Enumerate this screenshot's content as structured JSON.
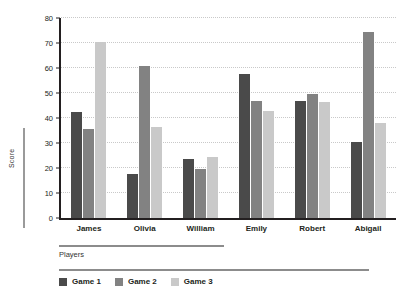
{
  "chart_data": {
    "type": "bar",
    "title": "",
    "xlabel": "Players",
    "ylabel": "Score",
    "ylim": [
      0,
      80
    ],
    "yticks": [
      0,
      10,
      20,
      30,
      40,
      50,
      60,
      70,
      80
    ],
    "grid": true,
    "legend_position": "bottom-left",
    "categories": [
      "James",
      "Olivia",
      "William",
      "Emily",
      "Robert",
      "Abigail"
    ],
    "series": [
      {
        "name": "Game 1",
        "color": "#4a4a4a",
        "values": [
          42.5,
          17.5,
          23.5,
          57.5,
          47,
          30.5
        ]
      },
      {
        "name": "Game 2",
        "color": "#828282",
        "values": [
          35.5,
          61,
          19.5,
          47,
          49.5,
          74.5
        ]
      },
      {
        "name": "Game 3",
        "color": "#c9c9c9",
        "values": [
          70.5,
          36.5,
          24.5,
          43,
          46.5,
          38
        ]
      }
    ]
  },
  "axis": {
    "y_title": "Score",
    "x_title": "Players",
    "tick_labels": [
      "80",
      "70",
      "60",
      "50",
      "40",
      "30",
      "20",
      "10",
      "0"
    ]
  },
  "legend": {
    "items": [
      {
        "label": "Game 1",
        "color": "#4a4a4a"
      },
      {
        "label": "Game 2",
        "color": "#828282"
      },
      {
        "label": "Game 3",
        "color": "#c9c9c9"
      }
    ]
  }
}
